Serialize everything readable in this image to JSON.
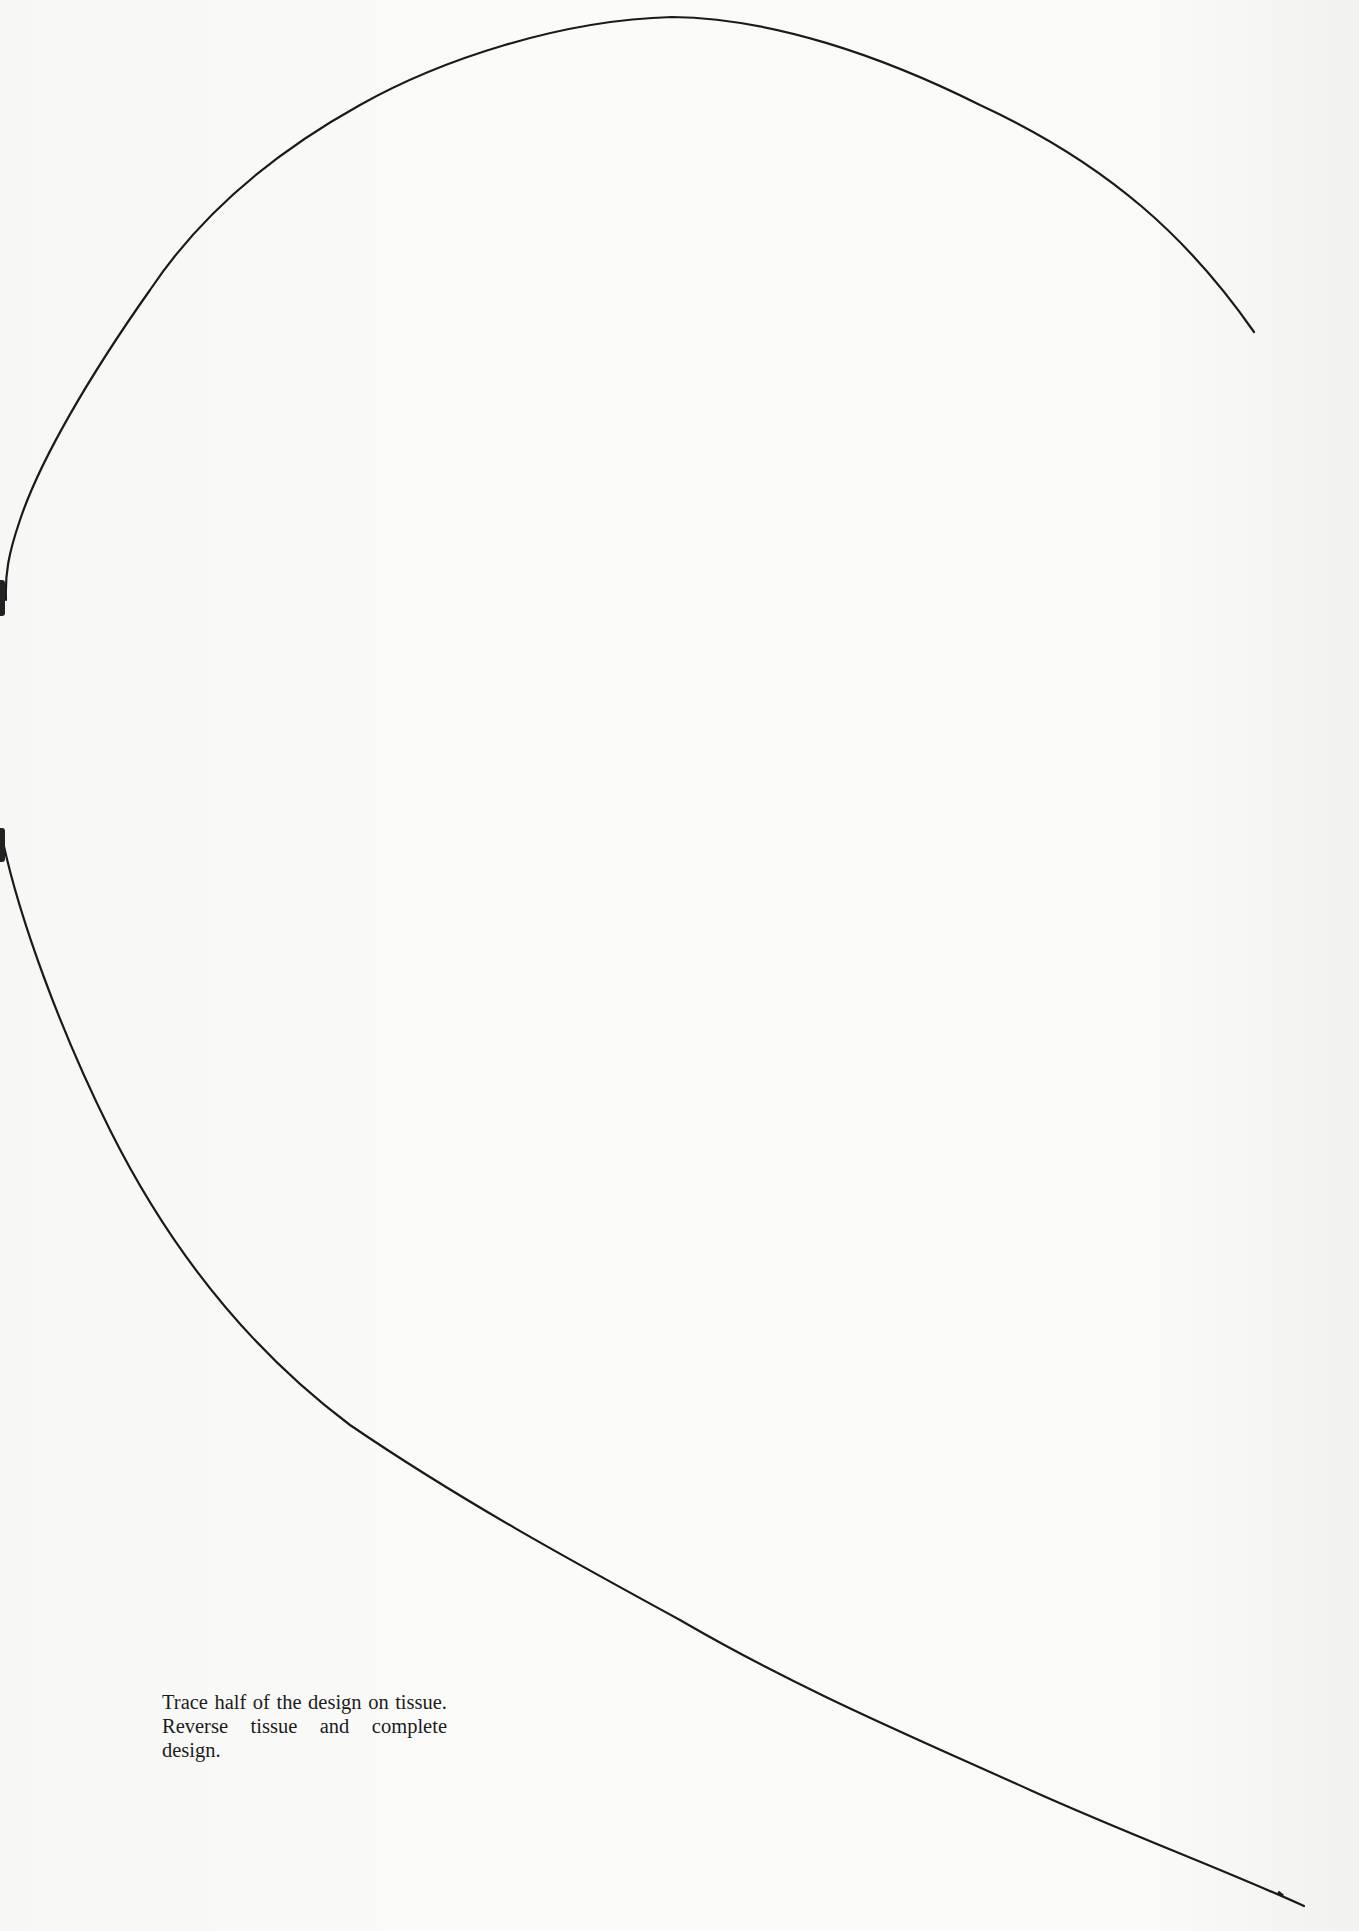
{
  "page": {
    "type": "pattern-template",
    "background_color": "#f9f9f8",
    "line_color": "#1a1a1a"
  },
  "pattern": {
    "shape": "half-heart outline (open curve)",
    "description": "Single curved outline running from top-right, over the top, down the left edge, and sweeping to the bottom-right corner",
    "fold_marks": [
      "upper-left-edge",
      "lower-left-edge"
    ]
  },
  "instructions": {
    "text": "Trace half of the design on tissue. Reverse tissue and complete design."
  }
}
